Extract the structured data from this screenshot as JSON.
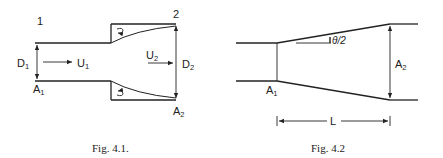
{
  "figures": [
    {
      "id": "fig-4-1",
      "caption": "Fig. 4.1.",
      "description": "Sudden expansion in a pipe",
      "labels": {
        "station_1": "1",
        "station_2": "2",
        "d1_main": "D",
        "d1_sub": "1",
        "u1_main": "U",
        "u1_sub": "1",
        "a1_main": "A",
        "a1_sub": "1",
        "u2_main": "U",
        "u2_sub": "2",
        "d2_main": "D",
        "d2_sub": "2",
        "a2_main": "A",
        "a2_sub": "2"
      }
    },
    {
      "id": "fig-4-2",
      "caption": "Fig. 4.2",
      "description": "Conical diffuser",
      "labels": {
        "angle": "θ/2",
        "a1_main": "A",
        "a1_sub": "1",
        "a2_main": "A",
        "a2_sub": "2",
        "length": "L"
      }
    }
  ],
  "colors": {
    "line": "#222222",
    "background": "#ffffff"
  }
}
